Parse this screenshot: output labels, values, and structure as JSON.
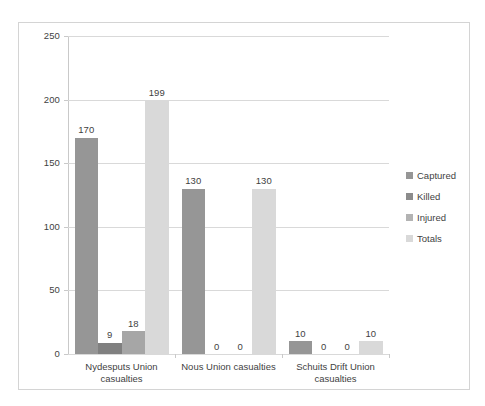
{
  "chart_data": {
    "type": "bar",
    "title": "",
    "subtitle": "",
    "xlabel": "",
    "ylabel": "",
    "ylim": [
      0,
      250
    ],
    "ytick_labels": [
      "250",
      "200",
      "150",
      "100",
      "50",
      "0"
    ],
    "ytick_values": [
      250,
      200,
      150,
      100,
      50,
      0
    ],
    "grid": true,
    "legend_position": "right",
    "categories": [
      "Nydesputs Union casualties",
      "Nous Union casualties",
      "Schuits Drift Union casualties"
    ],
    "series": [
      {
        "name": "Captured",
        "color": "#969696",
        "values": [
          170,
          130,
          10
        ],
        "labels": [
          "170",
          "130",
          "10"
        ]
      },
      {
        "name": "Killed",
        "color": "#808080",
        "values": [
          9,
          0,
          0
        ],
        "labels": [
          "9",
          "0",
          "0"
        ]
      },
      {
        "name": "Injured",
        "color": "#a6a6a6",
        "values": [
          18,
          0,
          0
        ],
        "labels": [
          "18",
          "0",
          "0"
        ]
      },
      {
        "name": "Totals",
        "color": "#d9d9d9",
        "values": [
          199,
          130,
          10
        ],
        "labels": [
          "199",
          "130",
          "10"
        ]
      }
    ]
  },
  "legend": {
    "items": [
      {
        "label": "Captured",
        "color": "#969696"
      },
      {
        "label": "Killed",
        "color": "#8c8c8c"
      },
      {
        "label": "Injured",
        "color": "#b3b3b3"
      },
      {
        "label": "Totals",
        "color": "#d9d9d9"
      }
    ]
  },
  "colors": {
    "frame_border": "#d4d4d4",
    "gridline": "#d9d9d9",
    "axis": "#c9c9c9",
    "text": "#3f3f3f",
    "background": "#ffffff"
  }
}
